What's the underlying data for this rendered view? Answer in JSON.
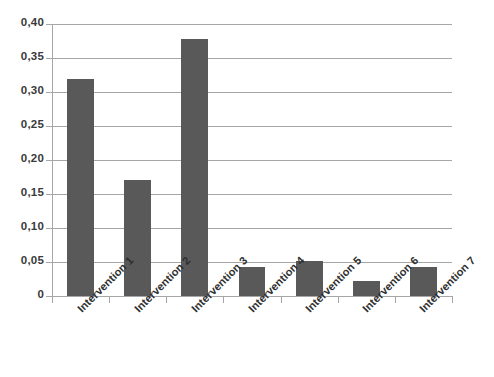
{
  "chart_data": {
    "type": "bar",
    "title": "",
    "subtitle": "",
    "xlabel": "",
    "ylabel": "",
    "categories": [
      "Intervention 1",
      "Intervention 2",
      "Intervention 3",
      "Intervention 4",
      "Intervention 5",
      "Intervention 6",
      "Intervention 7"
    ],
    "values": [
      0.319,
      0.171,
      0.378,
      0.043,
      0.052,
      0.022,
      0.042
    ],
    "ylim": [
      0,
      0.4
    ],
    "ytick_values": [
      0,
      0.05,
      0.1,
      0.15,
      0.2,
      0.25,
      0.3,
      0.35,
      0.4
    ],
    "ytick_labels": [
      "0",
      "0,05",
      "0,10",
      "0,15",
      "0,20",
      "0,25",
      "0,30",
      "0,35",
      "0,40"
    ],
    "decimal_separator": ",",
    "grid": true,
    "grid_axis": "y",
    "legend": false,
    "legend_position": "none",
    "bar_color": "#595959",
    "grid_color": "#a6a6a6",
    "axis_color": "#a6a6a6",
    "background_color": "#ffffff",
    "label_color": "#2f2f2f",
    "xtick_label_rotation": -45,
    "bar_width_ratio": 0.47
  }
}
